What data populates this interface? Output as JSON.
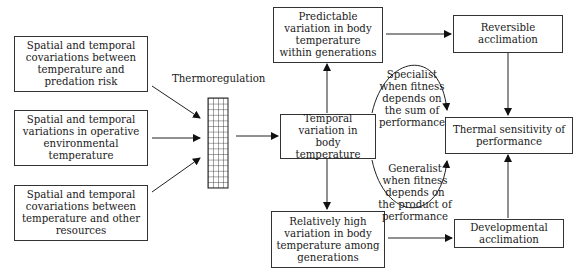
{
  "diagram": {
    "inputs": [
      {
        "id": "predation",
        "text": "Spatial and temporal covariations between temperature and predation risk"
      },
      {
        "id": "operative",
        "text": "Spatial and temporal variations in operative environmental temperature"
      },
      {
        "id": "resources",
        "text": "Spatial and temporal covariations between temperature and other resources"
      }
    ],
    "filter_label": "Thermoregulation",
    "temporal_variation": "Temporal variation in body temperature",
    "predictable_within": "Predictable variation in body temperature within generations",
    "high_among": "Relatively high variation in body temperature among generations",
    "reversible_acclimation": "Reversible acclimation",
    "developmental_acclimation": "Developmental acclimation",
    "thermal_sensitivity": "Thermal sensitivity of performance",
    "specialist_label": "Specialist when fitness depends on the sum of performance",
    "generalist_label": "Generalist when fitness depends on the product of performance"
  }
}
